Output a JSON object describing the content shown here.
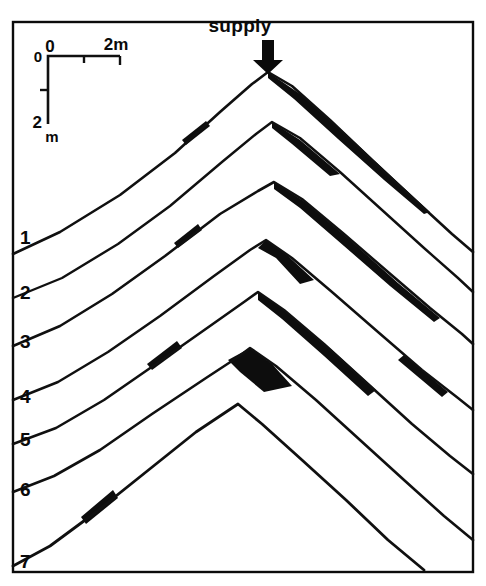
{
  "figure": {
    "title_annotation": "supply",
    "frame": {
      "x": 13,
      "y": 22,
      "width": 460,
      "height": 550
    },
    "background_color": "#ffffff",
    "line_color": "#101010",
    "fill_color": "#0d0d0d"
  },
  "supply_marker": {
    "label": "supply",
    "label_x": 240,
    "label_y": 32,
    "arrow_x": 268,
    "arrow_top": 40,
    "arrow_bottom": 74,
    "icon": "down-arrow-icon"
  },
  "scale_bar": {
    "origin_label_vertical": "0",
    "origin_label_horizontal": "0",
    "horizontal_end_label": "2m",
    "vertical_end_label_value": "2",
    "vertical_end_label_unit": "m",
    "corner_x": 48,
    "corner_y": 56,
    "horizontal_length": 72,
    "vertical_length": 68,
    "horizontal_midtick_offset": 36,
    "vertical_midtick_offset": 34
  },
  "profile_labels": [
    {
      "text": "1",
      "x": 20,
      "y": 244
    },
    {
      "text": "2",
      "x": 20,
      "y": 299
    },
    {
      "text": "3",
      "x": 20,
      "y": 348
    },
    {
      "text": "4",
      "x": 20,
      "y": 403
    },
    {
      "text": "5",
      "x": 20,
      "y": 446
    },
    {
      "text": "6",
      "x": 20,
      "y": 496
    },
    {
      "text": "7",
      "x": 20,
      "y": 568
    }
  ],
  "chart_data": {
    "type": "line",
    "xlabel": "",
    "ylabel": "",
    "legend_position": "left-inline",
    "grid": false,
    "axis_note": "scale bar: 2 m horizontal, 2 m vertical",
    "series": [
      {
        "name": "1",
        "crest_x": 268,
        "crest_y": 72,
        "path": "M 13,254 L 60,232 L 120,195 L 175,153 L 220,112 L 252,84 L 268,72 L 292,86 L 330,120 L 372,160 L 415,200 L 452,234 L 473,252",
        "wedges": [
          {
            "name": "right-flank-accretion",
            "path": "M 268,72 L 300,94 L 345,133 L 392,177 L 430,212 L 424,214 L 384,180 L 338,139 L 294,99 L 268,78 Z"
          },
          {
            "name": "left-flank-accretion",
            "path": "M 186,145 L 210,126 L 206,121 L 182,140 Z"
          }
        ]
      },
      {
        "name": "2",
        "crest_x": 272,
        "crest_y": 122,
        "path": "M 13,298 L 62,278 L 118,244 L 170,206 L 222,162 L 256,134 L 272,122 L 300,138 L 340,172 L 382,210 L 424,248 L 458,278 L 473,292",
        "wedges": [
          {
            "name": "crest-accretion",
            "path": "M 272,122 L 300,140 L 340,174 L 330,176 L 292,144 L 272,128 Z"
          }
        ]
      },
      {
        "name": "3",
        "crest_x": 274,
        "crest_y": 182,
        "path": "M 13,346 L 60,326 L 112,294 L 165,256 L 220,214 L 258,191 L 274,182 L 302,199 L 344,234 L 388,272 L 430,308 L 462,334 L 473,344",
        "wedges": [
          {
            "name": "right-flank-accretion",
            "path": "M 274,182 L 305,202 L 350,240 L 398,283 L 440,318 L 434,322 L 390,286 L 344,246 L 300,208 L 274,189 Z"
          },
          {
            "name": "left-flank-accretion",
            "path": "M 178,248 L 202,230 L 198,224 L 174,243 Z"
          }
        ]
      },
      {
        "name": "4",
        "crest_x": 266,
        "crest_y": 240,
        "path": "M 13,400 L 58,382 L 108,352 L 160,316 L 214,276 L 250,250 L 266,240 L 292,258 L 332,292 L 378,332 L 422,370 L 458,398 L 473,410",
        "wedges": [
          {
            "name": "crest-cap",
            "path": "M 266,240 L 288,256 L 314,280 L 300,284 L 276,258 L 258,248 Z"
          },
          {
            "name": "right-lower-accretion",
            "path": "M 404,355 L 448,392 L 442,397 L 398,360 Z"
          }
        ]
      },
      {
        "name": "5",
        "crest_x": 258,
        "crest_y": 292,
        "path": "M 13,444 L 56,428 L 104,400 L 156,364 L 210,326 L 244,302 L 258,292 L 284,310 L 324,344 L 368,384 L 412,424 L 450,456 L 473,474",
        "wedges": [
          {
            "name": "right-flank-accretion",
            "path": "M 258,292 L 288,313 L 332,350 L 376,390 L 368,396 L 324,356 L 282,319 L 258,300 Z"
          },
          {
            "name": "left-flank-accretion",
            "path": "M 152,370 L 182,348 L 177,341 L 147,364 Z"
          }
        ]
      },
      {
        "name": "6",
        "crest_x": 250,
        "crest_y": 348,
        "path": "M 13,492 L 54,476 L 100,450 L 152,414 L 206,378 L 238,357 L 250,348 L 276,366 L 316,400 L 360,440 L 404,480 L 444,516 L 473,540",
        "wedges": [
          {
            "name": "crest-black-cap",
            "path": "M 250,348 L 272,364 L 292,386 L 264,392 L 240,372 L 228,360 Z"
          }
        ]
      },
      {
        "name": "7",
        "crest_x": 238,
        "crest_y": 404,
        "path": "M 13,566 L 50,546 L 96,512 L 146,472 L 196,432 L 226,412 L 238,404 L 262,424 L 302,460 L 346,500 L 388,540 L 424,570",
        "wedges": [
          {
            "name": "left-flank-accretion",
            "path": "M 86,524 L 118,498 L 113,490 L 81,517 Z"
          }
        ]
      }
    ]
  }
}
